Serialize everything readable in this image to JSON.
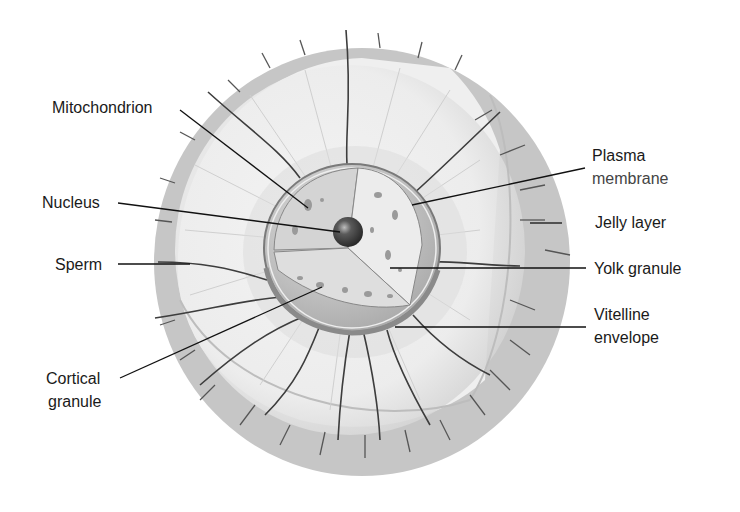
{
  "diagram": {
    "labels": {
      "mitochondrion": "Mitochondrion",
      "nucleus": "Nucleus",
      "sperm": "Sperm",
      "cortical_line1": "Cortical",
      "cortical_line2": "granule",
      "plasma_line1": "Plasma",
      "plasma_line2": "membrane",
      "jelly": "Jelly layer",
      "yolk": "Yolk granule",
      "vitelline_line1": "Vitelline",
      "vitelline_line2": "envelope"
    },
    "colors": {
      "background": "#ffffff",
      "jelly_band": "#c9c9c9",
      "jelly_inner": "#ececec",
      "cytoplasm": "#d6d6d6",
      "cut_face": "#e6e6e6",
      "nucleus": "#4a4a4a",
      "leader_line": "#111111",
      "sperm": "#3a3a3a"
    }
  }
}
